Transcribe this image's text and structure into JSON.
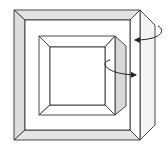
{
  "diagram": {
    "colors": {
      "background": "#ffffff",
      "stroke": "#333333",
      "bevel_fill": "#e4e4e4",
      "side_fill": "#d6d6d6",
      "face_fill": "#ffffff"
    },
    "frames": [
      {
        "name": "outer-frame",
        "arrow": "rotation-arrow-outer"
      },
      {
        "name": "inner-frame",
        "arrow": "rotation-arrow-inner"
      }
    ]
  }
}
